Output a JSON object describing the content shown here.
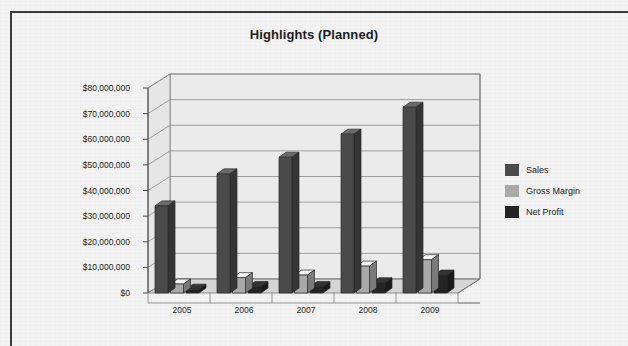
{
  "chart_data": {
    "type": "bar",
    "title": "Highlights (Planned)",
    "xlabel": "",
    "ylabel": "",
    "categories": [
      "2005",
      "2006",
      "2007",
      "2008",
      "2009"
    ],
    "series": [
      {
        "name": "Sales",
        "color": "#4a4a4a",
        "values": [
          34000000,
          46500000,
          53000000,
          62000000,
          72500000
        ]
      },
      {
        "name": "Gross Margin",
        "color": "#a9a9a9",
        "values": [
          3500000,
          6000000,
          7000000,
          10500000,
          13000000
        ]
      },
      {
        "name": "Net Profit",
        "color": "#242424",
        "values": [
          1500000,
          2500000,
          2500000,
          4000000,
          7000000
        ]
      }
    ],
    "ylim": [
      0,
      80000000
    ],
    "ytick_values": [
      0,
      10000000,
      20000000,
      30000000,
      40000000,
      50000000,
      60000000,
      70000000,
      80000000
    ],
    "ytick_labels": [
      "$0",
      "$10,000,000",
      "$20,000,000",
      "$30,000,000",
      "$40,000,000",
      "$50,000,000",
      "$60,000,000",
      "$70,000,000",
      "$80,000,000"
    ],
    "grid": true,
    "legend_position": "right",
    "style": "3d-column"
  },
  "legend": {
    "entries": [
      {
        "label": "Sales",
        "color": "#4a4a4a"
      },
      {
        "label": "Gross Margin",
        "color": "#a9a9a9"
      },
      {
        "label": "Net Profit",
        "color": "#242424"
      }
    ]
  },
  "colors": {
    "background": "#f3f3f3",
    "frame": "#3b3b3b",
    "text": "#1d1d1d",
    "grid": "#8a8a8a",
    "wall": "#ebebeb",
    "floor": "#d5d5d5"
  }
}
